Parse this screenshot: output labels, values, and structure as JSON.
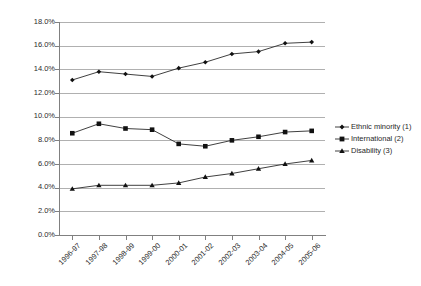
{
  "chart_data": {
    "type": "line",
    "title": "",
    "subtitle": "",
    "xlabel": "",
    "ylabel": "",
    "ylim": [
      0,
      18
    ],
    "ytick_labels": [
      "18.0%",
      "16.0%",
      "14.0%",
      "12.0%",
      "10.0%",
      "8.0%",
      "6.0%",
      "4.0%",
      "2.0%",
      "0.0%"
    ],
    "ytick_values": [
      18,
      16,
      14,
      12,
      10,
      8,
      6,
      4,
      2,
      0
    ],
    "grid": true,
    "legend_position": "right",
    "categories": [
      "1996-97",
      "1997-98",
      "1998-99",
      "1999-00",
      "2000-01",
      "2001-02",
      "2002-03",
      "2003-04",
      "2004-05",
      "2005-06"
    ],
    "series": [
      {
        "name": "Ethnic minority (1)",
        "marker": "diamond",
        "color": "#111111",
        "values": [
          13.1,
          13.8,
          13.6,
          13.4,
          14.1,
          14.6,
          15.3,
          15.5,
          16.2,
          16.3
        ]
      },
      {
        "name": "International (2)",
        "marker": "square",
        "color": "#111111",
        "values": [
          8.6,
          9.4,
          9.0,
          8.9,
          7.7,
          7.5,
          8.0,
          8.3,
          8.7,
          8.8
        ]
      },
      {
        "name": "Disability (3)",
        "marker": "triangle",
        "color": "#111111",
        "values": [
          3.9,
          4.2,
          4.2,
          4.2,
          4.4,
          4.9,
          5.2,
          5.6,
          6.0,
          6.3
        ]
      }
    ]
  },
  "legend": {
    "items": [
      {
        "label": "Ethnic minority (1)",
        "marker": "diamond"
      },
      {
        "label": "International (2)",
        "marker": "square"
      },
      {
        "label": "Disability (3)",
        "marker": "triangle"
      }
    ]
  }
}
